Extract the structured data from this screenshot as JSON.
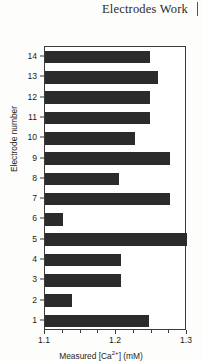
{
  "header": {
    "title": "Electrodes Work",
    "rule_icon": "vertical-rule-icon"
  },
  "ghost_text": {
    "top": "",
    "bottom": ""
  },
  "chart_data": {
    "type": "bar",
    "orientation": "horizontal",
    "title": "",
    "xlabel": "Measured [Ca2+] (mM)",
    "xlabel_parts": {
      "prefix": "Measured [Ca",
      "superscript": "2+",
      "suffix": "] (mM)"
    },
    "ylabel": "Electrode number",
    "xlim": [
      1.1,
      1.3
    ],
    "ylim": [
      0.5,
      14.5
    ],
    "grid": false,
    "legend": null,
    "bar_color": "#2b2b2b",
    "axis_color": "#3a3a3a",
    "xticks": [
      1.1,
      1.2,
      1.3
    ],
    "xticklabels": [
      "1.1",
      "1.2",
      "1.3"
    ],
    "xminorticks": [
      1.125,
      1.15,
      1.175,
      1.225,
      1.25,
      1.275
    ],
    "categories": [
      1,
      2,
      3,
      4,
      5,
      6,
      7,
      8,
      9,
      10,
      11,
      12,
      13,
      14
    ],
    "yticklabels": [
      "1",
      "2",
      "3",
      "4",
      "5",
      "6",
      "7",
      "8",
      "9",
      "10",
      "11",
      "12",
      "13",
      "14"
    ],
    "values": [
      1.246,
      1.138,
      1.207,
      1.207,
      1.3,
      1.125,
      1.276,
      1.204,
      1.276,
      1.227,
      1.248,
      1.248,
      1.259,
      1.248
    ]
  }
}
